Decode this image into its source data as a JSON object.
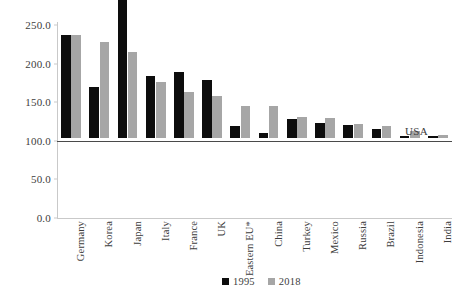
{
  "chart_data": {
    "type": "bar",
    "title": "",
    "subtitle": "",
    "xlabel": "",
    "ylabel": "",
    "ylim": [
      0,
      250
    ],
    "yticks": [
      0,
      50,
      100,
      150,
      200,
      250
    ],
    "ytick_labels": [
      "0.0",
      "50.0",
      "100.0",
      "150.0",
      "200.0",
      "250.0"
    ],
    "grid": false,
    "legend_position": "bottom-right",
    "categories": [
      "Germany",
      "Korea",
      "Japan",
      "Italy",
      "France",
      "UK",
      "Eastern EU*",
      "China",
      "Turkey",
      "Mexico",
      "Russia",
      "Brazil",
      "Indonesia",
      "India"
    ],
    "series": [
      {
        "name": "1995",
        "color": "#0d0d0d",
        "values": [
          134,
          66,
          208,
          80,
          85,
          75,
          16,
          7,
          25,
          19,
          17,
          12,
          3,
          2
        ]
      },
      {
        "name": "2018",
        "color": "#a6a6a6",
        "values": [
          134,
          125,
          111,
          72,
          59,
          54,
          42,
          42,
          27,
          26,
          18,
          15,
          9,
          4
        ]
      }
    ],
    "annotations": [
      {
        "name": "usa-reference-line",
        "label": "USA",
        "value": 100,
        "type": "horizontal-line",
        "color": "#4a4a4a"
      }
    ]
  },
  "legend": {
    "items": [
      {
        "label": "1995",
        "color": "#0d0d0d"
      },
      {
        "label": "2018",
        "color": "#a6a6a6"
      }
    ]
  }
}
